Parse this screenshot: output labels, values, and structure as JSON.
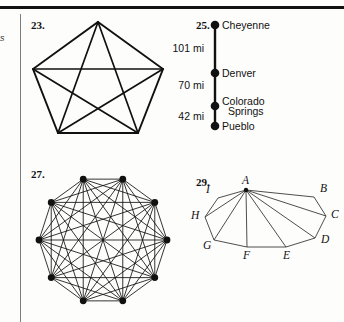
{
  "page": {
    "width": 344,
    "height": 322,
    "background": "#fdfdfc",
    "ink": "#111111",
    "rule_color": "#7d7d7d",
    "margin_fragment": "s"
  },
  "exercises": [
    {
      "number": "23.",
      "type": "complete-graph",
      "vertices": 5,
      "shape": "pentagon",
      "edges": 10
    },
    {
      "number": "25.",
      "type": "distance-line-diagram",
      "orientation": "vertical",
      "cities": [
        {
          "name": "Cheyenne"
        },
        {
          "name": "Denver"
        },
        {
          "name": "Colorado",
          "name_line2": "Springs"
        },
        {
          "name": "Pueblo"
        }
      ],
      "distances": [
        "101 mi",
        "70 mi",
        "42 mi"
      ]
    },
    {
      "number": "27.",
      "type": "complete-graph",
      "vertices": 10,
      "shape": "decagon",
      "edges": 45
    },
    {
      "number": "29.",
      "type": "polygon-diagonals",
      "vertices": 9,
      "shape": "nonagon",
      "apex": "A",
      "labels": [
        "A",
        "B",
        "C",
        "D",
        "E",
        "F",
        "G",
        "H",
        "I"
      ]
    }
  ],
  "chart_data": {
    "type": "diagram",
    "figures": [
      {
        "id": "23",
        "title": "23.",
        "kind": "complete graph K5 drawn on a regular pentagon",
        "node_count": 5,
        "edge_count": 10,
        "nodes": [
          {
            "id": 0,
            "x": 98,
            "y": 22
          },
          {
            "id": 1,
            "x": 163,
            "y": 69
          },
          {
            "id": 2,
            "x": 138,
            "y": 133
          },
          {
            "id": 3,
            "x": 58,
            "y": 133
          },
          {
            "id": 4,
            "x": 33,
            "y": 69
          }
        ]
      },
      {
        "id": "25",
        "title": "25.",
        "kind": "vertical line diagram of four cities with segment distances in miles",
        "node_count": 4,
        "nodes": [
          {
            "label": "Cheyenne",
            "x": 215,
            "y": 25
          },
          {
            "label": "Denver",
            "x": 215,
            "y": 73
          },
          {
            "label": "Colorado Springs",
            "x": 215,
            "y": 106
          },
          {
            "label": "Pueblo",
            "x": 215,
            "y": 126
          }
        ],
        "segments": [
          {
            "from": "Cheyenne",
            "to": "Denver",
            "value": 101,
            "unit": "mi",
            "text": "101 mi"
          },
          {
            "from": "Denver",
            "to": "Colorado Springs",
            "value": 70,
            "unit": "mi",
            "text": "70 mi"
          },
          {
            "from": "Colorado Springs",
            "to": "Pueblo",
            "value": 42,
            "unit": "mi",
            "text": "42 mi"
          }
        ],
        "total_distance": 213
      },
      {
        "id": "27",
        "title": "27.",
        "kind": "complete graph K10 drawn on a regular decagon",
        "node_count": 10,
        "edge_count": 45,
        "center": {
          "x": 103,
          "y": 240
        },
        "radius": 65
      },
      {
        "id": "29",
        "title": "29.",
        "kind": "nonagon ABCDEFGHI with all diagonals drawn from vertex A",
        "node_count": 9,
        "diagonal_count": 6,
        "nodes": [
          {
            "label": "A",
            "x": 246,
            "y": 190
          },
          {
            "label": "B",
            "x": 314,
            "y": 197
          },
          {
            "label": "C",
            "x": 326,
            "y": 216
          },
          {
            "label": "D",
            "x": 315,
            "y": 238
          },
          {
            "label": "E",
            "x": 286,
            "y": 247
          },
          {
            "label": "F",
            "x": 247,
            "y": 247
          },
          {
            "label": "G",
            "x": 214,
            "y": 240
          },
          {
            "label": "H",
            "x": 205,
            "y": 217
          },
          {
            "label": "I",
            "x": 218,
            "y": 198
          }
        ]
      }
    ]
  }
}
